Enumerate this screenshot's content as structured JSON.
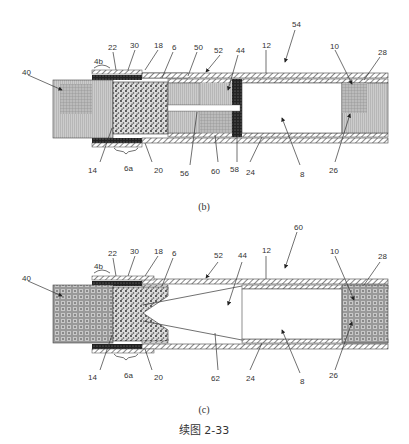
{
  "figure": {
    "title": "续图 2-33",
    "panels": [
      {
        "id": "b",
        "caption": "(b)",
        "labels": {
          "l40": "40",
          "l4b": "4b",
          "l22": "22",
          "l30": "30",
          "l18": "18",
          "l6": "6",
          "l50": "50",
          "l52": "52",
          "l44": "44",
          "l12": "12",
          "l54": "54",
          "l10": "10",
          "l28": "28",
          "l14": "14",
          "l6a": "6a",
          "l20": "20",
          "l56": "56",
          "l60": "60",
          "l58": "58",
          "l24": "24",
          "l8": "8",
          "l26": "26"
        }
      },
      {
        "id": "c",
        "caption": "(c)",
        "labels": {
          "l40": "40",
          "l4b": "4b",
          "l22": "22",
          "l30": "30",
          "l18": "18",
          "l6": "6",
          "l52": "52",
          "l44": "44",
          "l12": "12",
          "l60": "60",
          "l10": "10",
          "l28": "28",
          "l14": "14",
          "l6a": "6a",
          "l20": "20",
          "l62": "62",
          "l24": "24",
          "l8": "8",
          "l26": "26"
        }
      }
    ]
  }
}
